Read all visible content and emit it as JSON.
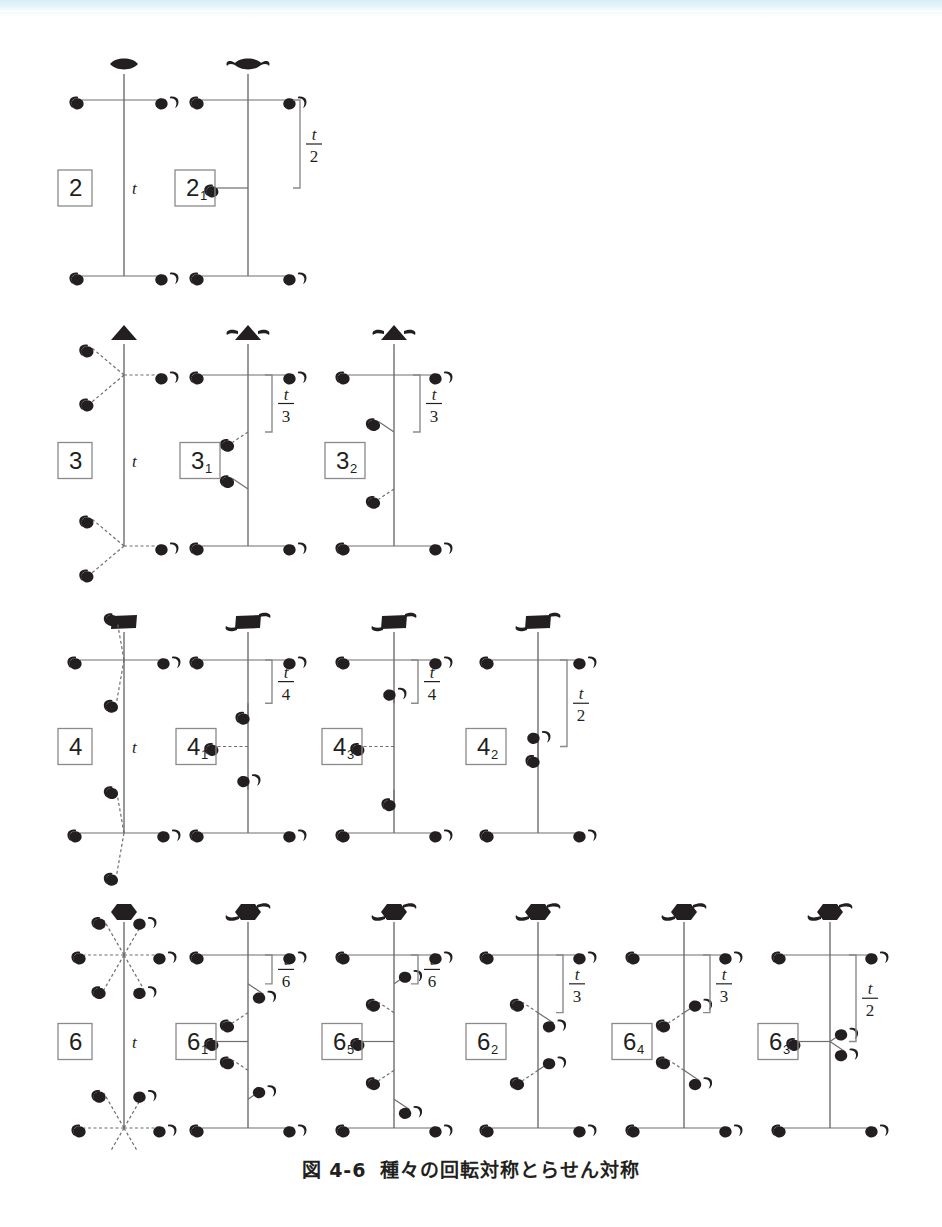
{
  "figure": {
    "caption_number": "図 4-6",
    "caption_text": "種々の回転対称とらせん対称",
    "axis_period_label": "t",
    "colors": {
      "ink": "#231f20",
      "line": "#6e6e6e",
      "box_border": "#8a8a8a",
      "top_band": "#d9eef8",
      "background": "#ffffff"
    }
  },
  "chart_data": {
    "type": "diagram",
    "title": "種々の回転対称とらせん対称",
    "rows": [
      {
        "fold": 2,
        "columns": [
          {
            "label": "2",
            "label_sub": "",
            "axis_symbol": "lens",
            "translation": "",
            "translation_num": "",
            "translation_den": "",
            "motifs_per_level": 2,
            "has_bracket": false,
            "axis_label": "t"
          },
          {
            "label": "2",
            "label_sub": "1",
            "axis_symbol": "lens-tail",
            "translation": "t/2",
            "translation_num": "t",
            "translation_den": "2",
            "motifs_per_level": 2,
            "has_bracket": true,
            "axis_label": ""
          }
        ]
      },
      {
        "fold": 3,
        "columns": [
          {
            "label": "3",
            "label_sub": "",
            "axis_symbol": "triangle",
            "translation": "",
            "translation_num": "",
            "translation_den": "",
            "motifs_per_level": 3,
            "has_bracket": false,
            "axis_label": "t"
          },
          {
            "label": "3",
            "label_sub": "1",
            "axis_symbol": "triangle-tail",
            "translation": "t/3",
            "translation_num": "t",
            "translation_den": "3",
            "motifs_per_level": 3,
            "has_bracket": true,
            "axis_label": ""
          },
          {
            "label": "3",
            "label_sub": "2",
            "axis_symbol": "triangle-tail",
            "translation": "t/3",
            "translation_num": "t",
            "translation_den": "3",
            "motifs_per_level": 3,
            "has_bracket": true,
            "axis_label": ""
          }
        ]
      },
      {
        "fold": 4,
        "columns": [
          {
            "label": "4",
            "label_sub": "",
            "axis_symbol": "square",
            "translation": "",
            "translation_num": "",
            "translation_den": "",
            "motifs_per_level": 4,
            "has_bracket": false,
            "axis_label": "t"
          },
          {
            "label": "4",
            "label_sub": "1",
            "axis_symbol": "square-tail",
            "translation": "t/4",
            "translation_num": "t",
            "translation_den": "4",
            "motifs_per_level": 4,
            "has_bracket": true,
            "axis_label": ""
          },
          {
            "label": "4",
            "label_sub": "3",
            "axis_symbol": "square-tail",
            "translation": "t/4",
            "translation_num": "t",
            "translation_den": "4",
            "motifs_per_level": 4,
            "has_bracket": true,
            "axis_label": ""
          },
          {
            "label": "4",
            "label_sub": "2",
            "axis_symbol": "square-tail",
            "translation": "t/2",
            "translation_num": "t",
            "translation_den": "2",
            "motifs_per_level": 4,
            "has_bracket": true,
            "axis_label": ""
          }
        ]
      },
      {
        "fold": 6,
        "columns": [
          {
            "label": "6",
            "label_sub": "",
            "axis_symbol": "hexagon",
            "translation": "",
            "translation_num": "",
            "translation_den": "",
            "motifs_per_level": 6,
            "has_bracket": false,
            "axis_label": "t"
          },
          {
            "label": "6",
            "label_sub": "1",
            "axis_symbol": "hexagon-tail",
            "translation": "t/6",
            "translation_num": "t",
            "translation_den": "6",
            "motifs_per_level": 6,
            "has_bracket": true,
            "axis_label": ""
          },
          {
            "label": "6",
            "label_sub": "5",
            "axis_symbol": "hexagon-tail",
            "translation": "t/6",
            "translation_num": "t",
            "translation_den": "6",
            "motifs_per_level": 6,
            "has_bracket": true,
            "axis_label": ""
          },
          {
            "label": "6",
            "label_sub": "2",
            "axis_symbol": "hexagon-tail",
            "translation": "t/3",
            "translation_num": "t",
            "translation_den": "3",
            "motifs_per_level": 6,
            "has_bracket": true,
            "axis_label": ""
          },
          {
            "label": "6",
            "label_sub": "4",
            "axis_symbol": "hexagon-tail",
            "translation": "t/3",
            "translation_num": "t",
            "translation_den": "3",
            "motifs_per_level": 6,
            "has_bracket": true,
            "axis_label": ""
          },
          {
            "label": "6",
            "label_sub": "3",
            "axis_symbol": "hexagon-tail",
            "translation": "t/2",
            "translation_num": "t",
            "translation_den": "2",
            "motifs_per_level": 6,
            "has_bracket": true,
            "axis_label": ""
          }
        ]
      }
    ]
  }
}
